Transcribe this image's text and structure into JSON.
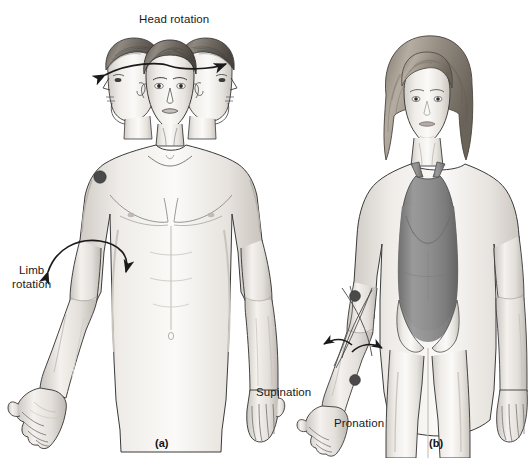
{
  "figure": {
    "type": "anatomy-illustration",
    "style": "grayscale pencil rendering",
    "background_color": "#ffffff",
    "ink_color": "#1a1a1a",
    "marker_color": "#4a4a4a",
    "leotard_color": "#8a8a8a",
    "skin_color": "#e9e6e2"
  },
  "panels": [
    {
      "caption": "(a)",
      "subject": "male figure, anterior view, three head positions",
      "labels": [
        {
          "text": "Head rotation",
          "lines": [
            "Head rotation"
          ]
        },
        {
          "text": "Limb rotation",
          "lines": [
            "Limb",
            "rotation"
          ]
        }
      ],
      "markers": [
        "shoulder-dot"
      ],
      "arrows": [
        "head-rotation-double-arrow",
        "limb-rotation-curved-double-arrow"
      ]
    },
    {
      "caption": "(b)",
      "subject": "female figure in leotard, anterior view, forearm rotation",
      "labels": [
        {
          "text": "Supination",
          "lines": [
            "Supination"
          ]
        },
        {
          "text": "Pronation",
          "lines": [
            "Pronation"
          ]
        }
      ],
      "markers": [
        "elbow-dot",
        "wrist-dot"
      ],
      "arrows": [
        "supination-curved-arrow",
        "pronation-curved-arrow"
      ]
    }
  ],
  "labels": {
    "head_rotation": "Head rotation",
    "limb_rotation_line1": "Limb",
    "limb_rotation_line2": "rotation",
    "supination": "Supination",
    "pronation": "Pronation"
  },
  "captions": {
    "panel_a": "(a)",
    "panel_b": "(b)"
  },
  "watermark": {
    "text": ""
  }
}
